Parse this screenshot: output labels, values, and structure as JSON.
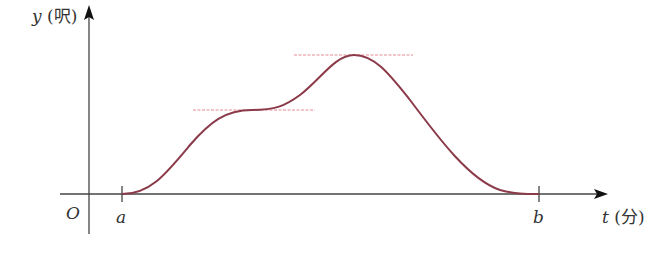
{
  "diagram": {
    "type": "function-graph",
    "y_axis": {
      "variable": "y",
      "unit": "(呎)"
    },
    "x_axis": {
      "variable": "t",
      "unit": "(分)"
    },
    "origin_label": "O",
    "ticks": [
      {
        "label": "a",
        "x": 122
      },
      {
        "label": "b",
        "x": 539
      }
    ],
    "curve": {
      "color": "#8b3a4a",
      "description": "rises from a, levels off at a plateau (inflection), rises to a maximum, then falls back to zero at b"
    },
    "reference_lines": [
      {
        "name": "plateau-line",
        "color": "#e07a85",
        "y": 110,
        "x1": 193,
        "x2": 315
      },
      {
        "name": "peak-line",
        "color": "#e07a85",
        "y": 55,
        "x1": 294,
        "x2": 413
      }
    ]
  }
}
